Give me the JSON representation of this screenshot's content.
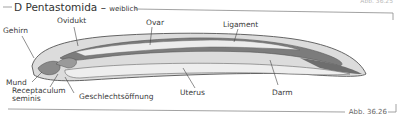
{
  "header": {
    "title": "D Pentastomida",
    "separator": "–",
    "subtitle": "weiblich",
    "faint_corner_text": "Abb. 36.25"
  },
  "figure_label": "Abb. 36.26",
  "labels": {
    "gehirn": "Gehirn",
    "ovidukt": "Ovidukt",
    "ovar": "Ovar",
    "ligament": "Ligament",
    "mund": "Mund",
    "receptaculum_line1": "Receptaculum",
    "receptaculum_line2": "seminis",
    "geschlechtsoeffnung": "Geschlechtsöffnung",
    "uterus": "Uterus",
    "darm": "Darm"
  },
  "colors": {
    "body_fill": "#d9d9d9",
    "organ_dark": "#7a7a7a",
    "organ_light": "#ececec",
    "outline": "#555555",
    "frame_line": "#9a9a9a"
  }
}
